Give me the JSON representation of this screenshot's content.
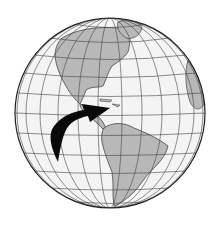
{
  "image": {
    "subject": "globe-western-hemisphere",
    "description": "Orthographic globe showing North and South America with a black curved arrow pointing from the Pacific toward the Caribbean",
    "colors": {
      "background": "#ffffff",
      "ocean": "#f4f4f4",
      "land": "#b8b8b8",
      "grid": "#444444",
      "outline": "#222222",
      "arrow": "#0a0a0a"
    },
    "globe": {
      "cx": 110,
      "cy": 113,
      "r": 95
    },
    "icons": [
      "globe-icon",
      "curved-arrow-icon"
    ]
  }
}
